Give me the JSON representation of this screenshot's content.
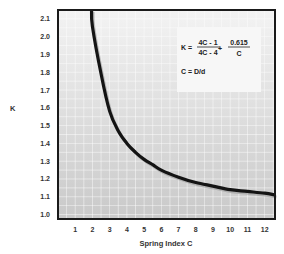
{
  "chart_data": {
    "type": "line",
    "title": "",
    "xlabel": "Spring Index C",
    "ylabel": "K",
    "xlim": [
      0,
      12.6
    ],
    "ylim": [
      0.975,
      2.15
    ],
    "x_ticks": [
      "1",
      "2",
      "3",
      "4",
      "5",
      "6",
      "7",
      "8",
      "9",
      "10",
      "11",
      "12"
    ],
    "y_ticks": [
      "1.0",
      "1.1",
      "1.2",
      "1.3",
      "1.4",
      "1.5",
      "1.6",
      "1.7",
      "1.8",
      "1.9",
      "2.0",
      "2.1"
    ],
    "grid": true,
    "legend": null,
    "series": [
      {
        "name": "Wahl correction factor K",
        "x": [
          1.95,
          2,
          2.5,
          3,
          3.5,
          4,
          4.5,
          5,
          5.5,
          6,
          7,
          8,
          9,
          10,
          11,
          12,
          12.6
        ],
        "y": [
          2.15,
          2.058,
          1.79,
          1.58,
          1.47,
          1.4,
          1.35,
          1.31,
          1.28,
          1.25,
          1.21,
          1.18,
          1.16,
          1.14,
          1.13,
          1.12,
          1.11
        ]
      }
    ],
    "annotations": {
      "formula_lhs": "K =",
      "frac1_num": "4C - 1",
      "frac1_den": "4C - 4",
      "plus": "+",
      "frac2_num": "0.615",
      "frac2_den": "C",
      "definition": "C = D/d"
    }
  }
}
